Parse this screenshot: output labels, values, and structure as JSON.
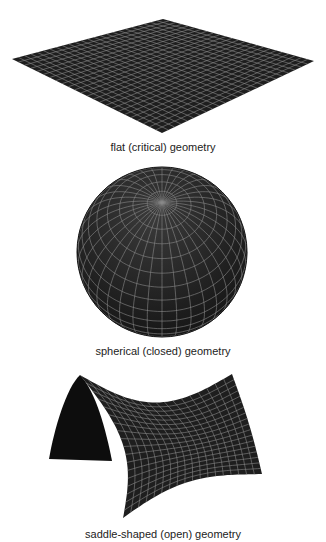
{
  "figure": {
    "background": "#ffffff",
    "surface_color": "#1e1e1e",
    "grid_color": "#8a8a8a",
    "panels": [
      {
        "id": "flat",
        "caption": "flat (critical) geometry",
        "shape": "flat-plane",
        "grid_divisions": 24
      },
      {
        "id": "spherical",
        "caption": "spherical (closed) geometry",
        "shape": "sphere",
        "meridians": 36,
        "parallels": 18
      },
      {
        "id": "saddle",
        "caption": "saddle-shaped (open) geometry",
        "shape": "saddle",
        "grid_divisions": 18
      }
    ]
  }
}
